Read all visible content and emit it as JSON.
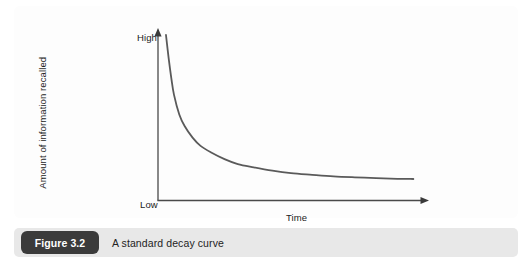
{
  "figure": {
    "caption_label": "Figure 3.2",
    "caption_text": "A standard decay curve",
    "badge_color": "#3b3b3b",
    "caption_bar_color": "#e8e8e8",
    "panel_color": "#fdfdfd"
  },
  "chart_data": {
    "type": "line",
    "title": "",
    "subtitle": "",
    "xlabel": "Time",
    "ylabel": "Amount of information recalled",
    "y_tick_labels": [
      "Low",
      "High"
    ],
    "x_tick_labels": [],
    "grid": false,
    "legend": null,
    "axis_color": "#4a4a4a",
    "line_color": "#5a5a5a",
    "line_width": 1.8,
    "xlim": [
      0,
      100
    ],
    "ylim": [
      0,
      100
    ],
    "series": [
      {
        "name": "Information recalled",
        "x": [
          3,
          4,
          5,
          6,
          8,
          10,
          13,
          16,
          20,
          25,
          30,
          36,
          43,
          50,
          58,
          66,
          74,
          82,
          90,
          96
        ],
        "y": [
          100,
          86,
          74,
          64,
          52,
          45,
          38,
          33,
          29,
          25,
          22,
          20,
          18,
          16.5,
          15.5,
          14.6,
          14.0,
          13.5,
          13.1,
          13.0
        ]
      }
    ],
    "annotations": []
  }
}
